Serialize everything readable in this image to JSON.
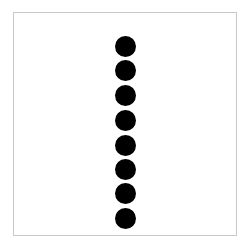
{
  "figure": {
    "frame": {
      "border_color": "#c8c8c8",
      "background": "#ffffff"
    },
    "dots": {
      "count": 8,
      "color": "#000000",
      "diameter": 21,
      "center_x": 125,
      "centers_y": [
        46,
        70,
        95,
        120,
        145,
        169,
        193,
        218
      ]
    }
  }
}
